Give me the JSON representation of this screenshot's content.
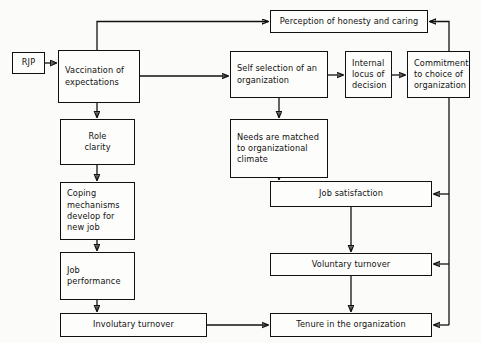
{
  "diagram": {
    "stroke_color": "#111111",
    "box_fill": "#fdfdfb",
    "background": "#fbfbf9",
    "nodes": [
      {
        "id": "rjp",
        "label": "RJP",
        "lines": [
          "RJP"
        ],
        "x": 12,
        "y": 52,
        "w": 33,
        "h": 22,
        "align": "center"
      },
      {
        "id": "vaccination",
        "label": "Vaccination of expectations",
        "lines": [
          "Vaccination of",
          "expectations"
        ],
        "x": 58,
        "y": 50,
        "w": 82,
        "h": 53,
        "align": "left"
      },
      {
        "id": "perception",
        "label": "Perception of honesty and caring",
        "lines": [
          "Perception of honesty and caring"
        ],
        "x": 270,
        "y": 10,
        "w": 158,
        "h": 23,
        "align": "center"
      },
      {
        "id": "selfselection",
        "label": "Self selection of an organization",
        "lines": [
          "Self selection of an",
          "organization"
        ],
        "x": 230,
        "y": 51,
        "w": 98,
        "h": 47,
        "align": "left"
      },
      {
        "id": "internallocus",
        "label": "Internal locus of decision",
        "lines": [
          "Internal",
          "locus of",
          "decision"
        ],
        "x": 345,
        "y": 51,
        "w": 47,
        "h": 47,
        "align": "left"
      },
      {
        "id": "commitment",
        "label": "Commitment to choice of organization",
        "lines": [
          "Commitment",
          "to choice of",
          "organization"
        ],
        "x": 407,
        "y": 51,
        "w": 63,
        "h": 47,
        "align": "left"
      },
      {
        "id": "roleclarity",
        "label": "Role clarity",
        "lines": [
          "Role",
          "clarity"
        ],
        "x": 60,
        "y": 119,
        "w": 75,
        "h": 46,
        "align": "center"
      },
      {
        "id": "needsmatched",
        "label": "Needs are matched to organizational climate",
        "lines": [
          "Needs are matched",
          "to organizational",
          "climate"
        ],
        "x": 230,
        "y": 119,
        "w": 98,
        "h": 59,
        "align": "left"
      },
      {
        "id": "coping",
        "label": "Coping mechanisms develop for new job",
        "lines": [
          "Coping",
          "mechanisms",
          "develop for",
          "new job"
        ],
        "x": 60,
        "y": 182,
        "w": 75,
        "h": 58,
        "align": "left"
      },
      {
        "id": "jobsatisfaction",
        "label": "Job satisfaction",
        "lines": [
          "Job satisfaction"
        ],
        "x": 270,
        "y": 181,
        "w": 162,
        "h": 26,
        "align": "center"
      },
      {
        "id": "jobperformance",
        "label": "Job performance",
        "lines": [
          "Job",
          "performance"
        ],
        "x": 60,
        "y": 252,
        "w": 75,
        "h": 48,
        "align": "left"
      },
      {
        "id": "voluntary",
        "label": "Voluntary turnover",
        "lines": [
          "Voluntary turnover"
        ],
        "x": 270,
        "y": 253,
        "w": 162,
        "h": 23,
        "align": "center"
      },
      {
        "id": "involuntary",
        "label": "Involutary turnover",
        "lines": [
          "Involutary turnover"
        ],
        "x": 60,
        "y": 313,
        "w": 147,
        "h": 24,
        "align": "center"
      },
      {
        "id": "tenure",
        "label": "Tenure in the organization",
        "lines": [
          "Tenure in the organization"
        ],
        "x": 270,
        "y": 313,
        "w": 162,
        "h": 24,
        "align": "center"
      }
    ],
    "edges": [
      {
        "id": "rjp-to-vaccination",
        "from": "rjp",
        "to": "vaccination",
        "kind": "arrow"
      },
      {
        "id": "vaccination-to-perception",
        "from": "vaccination",
        "to": "perception",
        "kind": "arrow"
      },
      {
        "id": "vaccination-to-selfselection",
        "from": "vaccination",
        "to": "selfselection",
        "kind": "arrow"
      },
      {
        "id": "vaccination-to-roleclarity",
        "from": "vaccination",
        "to": "roleclarity",
        "kind": "arrow"
      },
      {
        "id": "selfselection-to-internallocus",
        "from": "selfselection",
        "to": "internallocus",
        "kind": "arrow"
      },
      {
        "id": "internallocus-to-commitment",
        "from": "internallocus",
        "to": "commitment",
        "kind": "arrow"
      },
      {
        "id": "commitment-to-perception",
        "from": "commitment",
        "to": "perception",
        "kind": "arrow"
      },
      {
        "id": "selfselection-to-needsmatched",
        "from": "selfselection",
        "to": "needsmatched",
        "kind": "arrow"
      },
      {
        "id": "needsmatched-to-jobsatisfaction",
        "from": "needsmatched",
        "to": "jobsatisfaction",
        "kind": "arrow"
      },
      {
        "id": "roleclarity-to-coping",
        "from": "roleclarity",
        "to": "coping",
        "kind": "arrow"
      },
      {
        "id": "coping-to-jobperformance",
        "from": "coping",
        "to": "jobperformance",
        "kind": "arrow"
      },
      {
        "id": "jobperformance-to-involuntary",
        "from": "jobperformance",
        "to": "involuntary",
        "kind": "arrow"
      },
      {
        "id": "involuntary-to-tenure",
        "from": "involuntary",
        "to": "tenure",
        "kind": "arrow"
      },
      {
        "id": "jobsatisfaction-to-voluntary",
        "from": "jobsatisfaction",
        "to": "voluntary",
        "kind": "arrow"
      },
      {
        "id": "voluntary-to-tenure",
        "from": "voluntary",
        "to": "tenure",
        "kind": "arrow"
      },
      {
        "id": "commitment-to-jobsatisfaction",
        "from": "commitment",
        "to": "jobsatisfaction",
        "kind": "arrow"
      },
      {
        "id": "commitment-to-voluntary",
        "from": "commitment",
        "to": "voluntary",
        "kind": "arrow"
      },
      {
        "id": "commitment-to-tenure",
        "from": "commitment",
        "to": "tenure",
        "kind": "arrow"
      }
    ]
  }
}
